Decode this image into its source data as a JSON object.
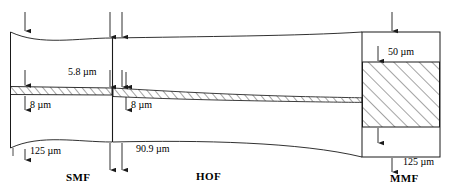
{
  "figure": {
    "background": "#ffffff",
    "stroke": "#1a1a1a"
  },
  "sections": [
    {
      "key": "smf",
      "label": "SMF",
      "x": 72,
      "y": 178
    },
    {
      "key": "hof",
      "label": "HOF",
      "x": 206,
      "y": 177
    },
    {
      "key": "mmf",
      "label": "MMF",
      "x": 401,
      "y": 179
    }
  ],
  "dimensions": [
    {
      "key": "gap",
      "label": "5.8 µm",
      "x": 68,
      "y": 72
    },
    {
      "key": "smf_core",
      "label": "8 µm",
      "x": 30,
      "y": 105
    },
    {
      "key": "hof_core",
      "label": "8 µm",
      "x": 131,
      "y": 105
    },
    {
      "key": "smf_clad",
      "label": "125 µm",
      "x": 30,
      "y": 149
    },
    {
      "key": "hof_clad",
      "label": "90.9 µm",
      "x": 136,
      "y": 148
    },
    {
      "key": "mmf_core",
      "label": "50 µm",
      "x": 390,
      "y": 52
    },
    {
      "key": "mmf_clad",
      "label": "125 µm",
      "x": 405,
      "y": 160
    }
  ],
  "icons": {
    "arrow_down": "arrow-down-icon",
    "arrow_up": "arrow-up-icon"
  }
}
